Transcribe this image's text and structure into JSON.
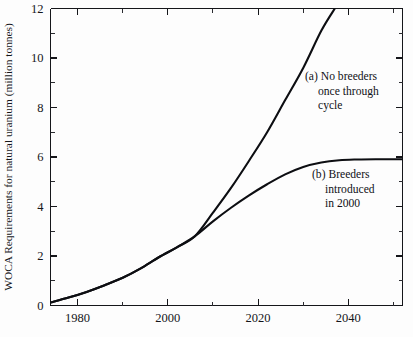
{
  "chart_data": {
    "type": "line",
    "title": "",
    "xlabel": "",
    "ylabel": "WOCA Requirements for natural uranium (million tonnes)",
    "xlim": [
      1974,
      2052
    ],
    "ylim": [
      0,
      12
    ],
    "grid": false,
    "legend_position": "inline-annotations",
    "x_major_ticks": [
      1980,
      2000,
      2020,
      2040
    ],
    "x_major_tick_labels": [
      "1980",
      "2000",
      "2020",
      "2040"
    ],
    "x_minor_ticks": [
      1990,
      2010,
      2030,
      2050
    ],
    "y_major_ticks": [
      0,
      2,
      4,
      6,
      8,
      10,
      12
    ],
    "y_major_tick_labels": [
      "0",
      "2",
      "4",
      "6",
      "8",
      "10",
      "12"
    ],
    "y_minor_ticks": [
      1,
      3,
      5,
      7,
      9,
      11
    ],
    "series": [
      {
        "name": "(a) No breeders once through cycle",
        "x": [
          1974,
          1978,
          1982,
          1986,
          1990,
          1994,
          1998,
          2002,
          2006,
          2010,
          2014,
          2018,
          2022,
          2026,
          2030,
          2034,
          2037
        ],
        "values": [
          0.12,
          0.32,
          0.55,
          0.82,
          1.12,
          1.5,
          1.95,
          2.35,
          2.8,
          3.75,
          4.75,
          5.85,
          7.0,
          8.3,
          9.6,
          11.1,
          12.0
        ]
      },
      {
        "name": "(b) Breeders introduced in 2000",
        "x": [
          1974,
          1978,
          1982,
          1986,
          1990,
          1994,
          1998,
          2002,
          2006,
          2010,
          2014,
          2018,
          2022,
          2026,
          2030,
          2034,
          2038,
          2042,
          2046,
          2052
        ],
        "values": [
          0.12,
          0.32,
          0.55,
          0.82,
          1.12,
          1.5,
          1.95,
          2.35,
          2.8,
          3.4,
          3.95,
          4.45,
          4.9,
          5.3,
          5.6,
          5.78,
          5.87,
          5.9,
          5.91,
          5.91
        ]
      }
    ],
    "annotations": [
      {
        "id": "annotation-a",
        "lines": [
          "(a) No breeders",
          "once through",
          "cycle"
        ],
        "x_px": 305,
        "y_px": 80
      },
      {
        "id": "annotation-b",
        "lines": [
          "(b) Breeders",
          "introduced",
          "in 2000"
        ],
        "x_px": 312,
        "y_px": 178
      }
    ],
    "colors": {
      "curve": "#0d0e12",
      "axis": "#15161a",
      "background": "#fdfdfd"
    }
  }
}
